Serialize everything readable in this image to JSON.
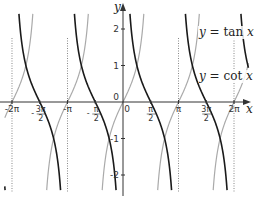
{
  "chart_data": {
    "type": "line",
    "title": "",
    "xlabel": "x",
    "ylabel": "y",
    "xlim": [
      -6.7,
      7.1
    ],
    "ylim": [
      -2.5,
      2.5
    ],
    "grid": false,
    "x_ticks": [
      {
        "value": -6.2832,
        "label": "-2π"
      },
      {
        "value": -4.7124,
        "num": "3π",
        "den": "2",
        "sign": "-"
      },
      {
        "value": -3.1416,
        "label": "-π"
      },
      {
        "value": -1.5708,
        "num": "π",
        "den": "2",
        "sign": "-"
      },
      {
        "value": 0,
        "label": "0"
      },
      {
        "value": 1.5708,
        "num": "π",
        "den": "2",
        "sign": ""
      },
      {
        "value": 3.1416,
        "label": "π"
      },
      {
        "value": 4.7124,
        "num": "3π",
        "den": "2",
        "sign": ""
      },
      {
        "value": 6.2832,
        "label": "2π"
      }
    ],
    "y_ticks": [
      {
        "value": 2,
        "label": "2"
      },
      {
        "value": 1,
        "label": "1"
      },
      {
        "value": 0,
        "label": "0"
      },
      {
        "value": -1,
        "label": "-1"
      },
      {
        "value": -2,
        "label": "-2"
      }
    ],
    "asymptotes": {
      "x_values": [
        -6.2832,
        -3.1416,
        3.1416,
        6.2832
      ],
      "style": "dotted"
    },
    "series": [
      {
        "name": "y = tan x",
        "function": "tan",
        "color": "#aaaaaa",
        "domain": [
          -6.7,
          7.1
        ]
      },
      {
        "name": "y = cot x",
        "function": "cot",
        "color": "#1a1a1a",
        "domain": [
          -6.7,
          7.1
        ]
      }
    ],
    "legend": [
      {
        "prefix": "y",
        "eq": " = tan ",
        "var": "x",
        "series": "tan",
        "placement": "right-upper"
      },
      {
        "prefix": "y",
        "eq": " = cot ",
        "var": "x",
        "series": "cot",
        "placement": "right-middle"
      }
    ],
    "colors": {
      "axis": "#333333",
      "asymptote": "#888888"
    }
  }
}
